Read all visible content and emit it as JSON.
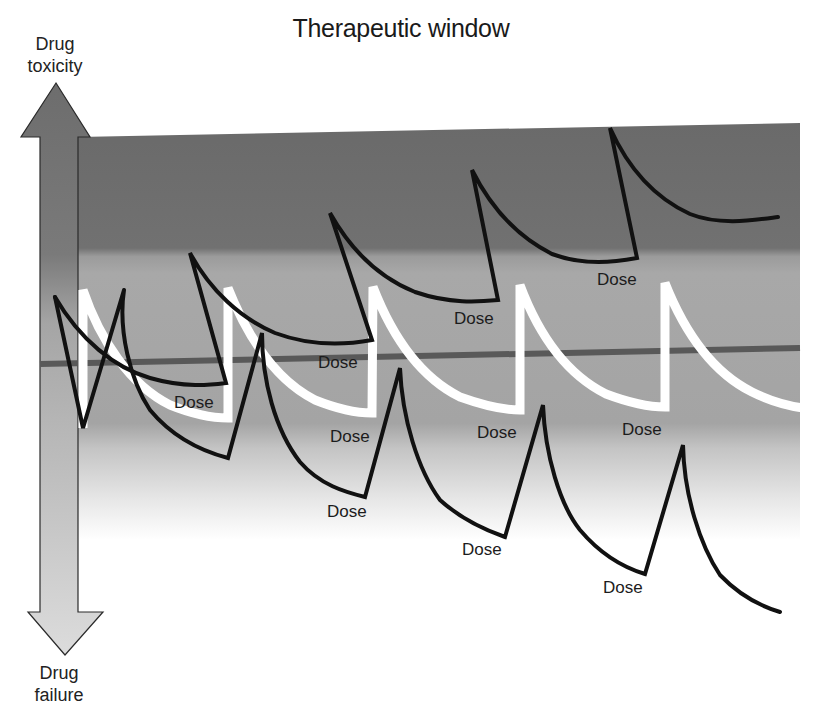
{
  "title": "Therapeutic window",
  "axis": {
    "top_label_line1": "Drug",
    "top_label_line2": "toxicity",
    "bottom_label_line1": "Drug",
    "bottom_label_line2": "failure"
  },
  "dose_label": "Dose",
  "dose_labels": [
    {
      "text": "Dose",
      "x": 174,
      "y": 408
    },
    {
      "text": "Dose",
      "x": 318,
      "y": 368
    },
    {
      "text": "Dose",
      "x": 454,
      "y": 324
    },
    {
      "text": "Dose",
      "x": 597,
      "y": 285
    },
    {
      "text": "Dose",
      "x": 330,
      "y": 442
    },
    {
      "text": "Dose",
      "x": 477,
      "y": 438
    },
    {
      "text": "Dose",
      "x": 622,
      "y": 435
    },
    {
      "text": "Dose",
      "x": 327,
      "y": 517
    },
    {
      "text": "Dose",
      "x": 462,
      "y": 555
    },
    {
      "text": "Dose",
      "x": 603,
      "y": 593
    }
  ],
  "colors": {
    "toxic_band": "#6e6e6e",
    "therapeutic_band": "#a3a3a3",
    "target_line": "#5a5a5a",
    "therapeutic_curve": "#ffffff",
    "subtherapeutic_curve": "#111111",
    "toxic_curve": "#111111",
    "arrow_top": "#6f6f6f",
    "arrow_bottom": "#d8d8d8"
  },
  "curves": [
    {
      "name": "Toxic dosing (above window)",
      "color": "#111111",
      "peaks": [
        [
          190,
          253
        ],
        [
          330,
          213
        ],
        [
          472,
          170
        ],
        [
          610,
          128
        ]
      ],
      "troughs": [
        [
          226,
          383
        ],
        [
          372,
          340
        ],
        [
          498,
          300
        ],
        [
          637,
          258
        ]
      ]
    },
    {
      "name": "Therapeutic dosing (within window)",
      "color": "#ffffff",
      "peaks": [
        [
          83,
          290
        ],
        [
          228,
          288
        ],
        [
          375,
          287
        ],
        [
          520,
          285
        ],
        [
          665,
          283
        ]
      ],
      "troughs": [
        [
          228,
          420
        ],
        [
          372,
          415
        ],
        [
          520,
          410
        ],
        [
          665,
          408
        ]
      ]
    },
    {
      "name": "Subtherapeutic dosing (below window)",
      "color": "#111111",
      "peaks": [
        [
          124,
          290
        ],
        [
          262,
          333
        ],
        [
          400,
          368
        ],
        [
          543,
          405
        ],
        [
          683,
          445
        ]
      ],
      "troughs": [
        [
          83,
          428
        ],
        [
          228,
          458
        ],
        [
          365,
          497
        ],
        [
          505,
          537
        ],
        [
          645,
          574
        ]
      ]
    }
  ]
}
